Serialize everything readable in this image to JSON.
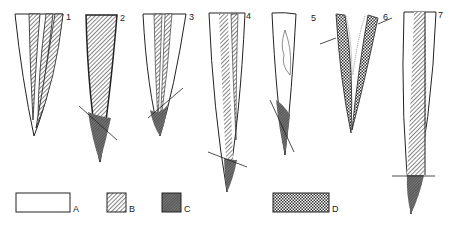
{
  "figure": {
    "specimens": [
      {
        "id": "1",
        "label": "1"
      },
      {
        "id": "2",
        "label": "2"
      },
      {
        "id": "3",
        "label": "3"
      },
      {
        "id": "4",
        "label": "4"
      },
      {
        "id": "5",
        "label": "5"
      },
      {
        "id": "6",
        "label": "6"
      },
      {
        "id": "7",
        "label": "7"
      }
    ],
    "legend": [
      {
        "key": "A",
        "label": "A",
        "pattern": "blank"
      },
      {
        "key": "B",
        "label": "B",
        "pattern": "diagonal-hatch"
      },
      {
        "key": "C",
        "label": "C",
        "pattern": "dense-stipple"
      },
      {
        "key": "D",
        "label": "D",
        "pattern": "crosshatch"
      }
    ],
    "colors": {
      "ink": "#222222",
      "paper": "#ffffff"
    }
  }
}
